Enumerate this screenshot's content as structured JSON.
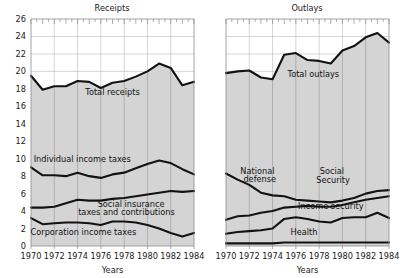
{
  "figure": {
    "width": 411,
    "height": 278,
    "background": "#ffffff",
    "line_color": "#121212",
    "fill_color": "#d4d4d4",
    "grid_color": "#b9b9b9"
  },
  "axis": {
    "xlabel": "Years",
    "ylabel": "",
    "ylim": [
      0,
      26
    ],
    "yticks": [
      0,
      2,
      4,
      6,
      8,
      10,
      12,
      14,
      16,
      18,
      20,
      22,
      24,
      26
    ],
    "ytick_labels": [
      "0",
      "2",
      "4",
      "6",
      "8",
      "10",
      "12",
      "14",
      "16",
      "18",
      "20",
      "22",
      "24",
      "26"
    ],
    "xlim": [
      1970,
      1984
    ],
    "xticks": [
      1970,
      1972,
      1974,
      1976,
      1978,
      1980,
      1982,
      1984
    ],
    "xtick_labels": [
      "1970",
      "1972",
      "1974",
      "1976",
      "1978",
      "1980",
      "1982",
      "1984"
    ],
    "grid": true,
    "legend": "inline-annotations"
  },
  "chart_data": [
    {
      "type": "area",
      "title": "Receipts",
      "xlabel": "Years",
      "ylabel": "",
      "ylim": [
        0,
        26
      ],
      "x": [
        1970,
        1971,
        1972,
        1973,
        1974,
        1975,
        1976,
        1977,
        1978,
        1979,
        1980,
        1981,
        1982,
        1983,
        1984
      ],
      "series": [
        {
          "name": "Total receipts",
          "label": "Total receipts",
          "values": [
            19.5,
            17.9,
            18.3,
            18.3,
            18.9,
            18.8,
            18.1,
            18.7,
            18.9,
            19.4,
            20.0,
            20.9,
            20.4,
            18.4,
            18.8
          ]
        },
        {
          "name": "Individual income taxes",
          "label": "Individual income taxes",
          "values": [
            9.0,
            8.1,
            8.1,
            8.0,
            8.4,
            8.0,
            7.8,
            8.2,
            8.4,
            8.9,
            9.4,
            9.8,
            9.5,
            8.8,
            8.2
          ]
        },
        {
          "name": "Social insurance taxes and contributions",
          "label": "Social insurance taxes and contributions",
          "values": [
            4.4,
            4.4,
            4.5,
            4.9,
            5.3,
            5.2,
            5.2,
            5.4,
            5.5,
            5.7,
            5.9,
            6.1,
            6.3,
            6.2,
            6.3
          ]
        },
        {
          "name": "Corporation income taxes",
          "label": "Corporation income taxes",
          "values": [
            3.2,
            2.5,
            2.6,
            2.7,
            2.7,
            2.6,
            2.4,
            2.8,
            2.8,
            2.7,
            2.4,
            2.0,
            1.5,
            1.1,
            1.5
          ]
        }
      ]
    },
    {
      "type": "area",
      "title": "Outlays",
      "xlabel": "Years",
      "ylabel": "",
      "ylim": [
        0,
        26
      ],
      "x": [
        1970,
        1971,
        1972,
        1973,
        1974,
        1975,
        1976,
        1977,
        1978,
        1979,
        1980,
        1981,
        1982,
        1983,
        1984
      ],
      "series": [
        {
          "name": "Total outlays",
          "label": "Total outlays",
          "values": [
            19.8,
            20.0,
            20.1,
            19.3,
            19.1,
            21.9,
            22.1,
            21.3,
            21.2,
            20.9,
            22.4,
            22.9,
            23.9,
            24.4,
            23.3
          ]
        },
        {
          "name": "National defense",
          "label": "National defense",
          "values": [
            8.3,
            7.6,
            7.0,
            6.1,
            5.8,
            5.7,
            5.3,
            5.2,
            5.1,
            5.0,
            5.2,
            5.5,
            6.0,
            6.3,
            6.4
          ]
        },
        {
          "name": "Social Security",
          "label": "Social Security",
          "values": [
            3.0,
            3.4,
            3.5,
            3.8,
            4.0,
            4.4,
            4.5,
            4.6,
            4.5,
            4.5,
            4.7,
            5.0,
            5.3,
            5.5,
            5.7
          ]
        },
        {
          "name": "Income security",
          "label": "Income security",
          "values": [
            1.4,
            1.6,
            1.7,
            1.8,
            2.0,
            3.1,
            3.3,
            3.1,
            2.8,
            2.7,
            3.2,
            3.3,
            3.3,
            3.8,
            3.2
          ]
        },
        {
          "name": "Health",
          "label": "Health",
          "values": [
            0.3,
            0.3,
            0.3,
            0.3,
            0.3,
            0.4,
            0.4,
            0.4,
            0.4,
            0.4,
            0.4,
            0.4,
            0.4,
            0.4,
            0.4
          ]
        }
      ]
    }
  ],
  "panels": [
    {
      "id": "receipts",
      "title": "Receipts",
      "annotations": [
        {
          "name": "total-receipts",
          "text": "Total receipts",
          "x": 1977.0,
          "y": 17.3
        },
        {
          "name": "individual-income-taxes",
          "text": "Individual income taxes",
          "x": 1974.4,
          "y": 9.6
        },
        {
          "name": "social-insurance-line1",
          "text": "Social insurance",
          "x": 1978.6,
          "y": 4.5
        },
        {
          "name": "social-insurance-line2",
          "text": "taxes and contributions",
          "x": 1978.2,
          "y": 3.5
        },
        {
          "name": "corporation-income-taxes",
          "text": "Corporation income taxes",
          "x": 1974.5,
          "y": 1.3
        }
      ]
    },
    {
      "id": "outlays",
      "title": "Outlays",
      "annotations": [
        {
          "name": "total-outlays",
          "text": "Total outlays",
          "x": 1977.5,
          "y": 19.4
        },
        {
          "name": "national-defense-line1",
          "text": "National",
          "x": 1972.7,
          "y": 8.3
        },
        {
          "name": "national-defense-line2",
          "text": "defense",
          "x": 1972.9,
          "y": 7.3
        },
        {
          "name": "social-security-line1",
          "text": "Social",
          "x": 1979.1,
          "y": 8.2
        },
        {
          "name": "social-security-line2",
          "text": "Security",
          "x": 1979.2,
          "y": 7.2
        },
        {
          "name": "income-security",
          "text": "Income security",
          "x": 1979.0,
          "y": 4.2
        },
        {
          "name": "health",
          "text": "Health",
          "x": 1976.7,
          "y": 1.3
        }
      ]
    }
  ]
}
